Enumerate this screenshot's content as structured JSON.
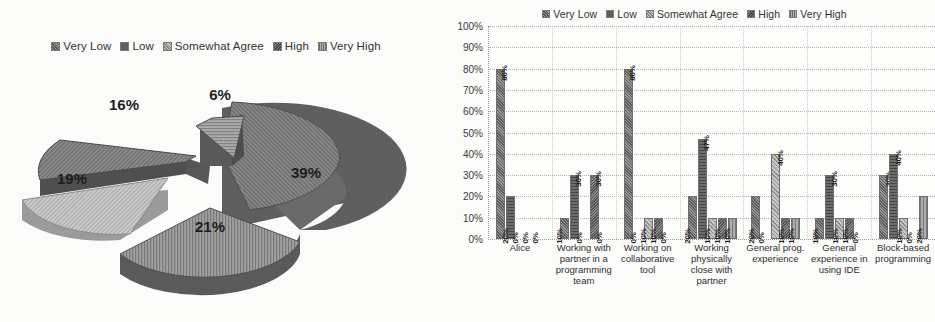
{
  "legend": {
    "entries": [
      {
        "label": "Very Low",
        "key": "verylow",
        "color": "#9a9a9a"
      },
      {
        "label": "Low",
        "key": "low",
        "color": "#5f5f5f"
      },
      {
        "label": "Somewhat Agree",
        "key": "somewhat",
        "color": "#c9c9c9"
      },
      {
        "label": "High",
        "key": "high",
        "color": "#7d7d7d"
      },
      {
        "label": "Very High",
        "key": "veryhigh",
        "color": "#b3b3b3"
      }
    ]
  },
  "chart_data": [
    {
      "type": "pie",
      "title": "",
      "exploded": true,
      "three_d": true,
      "legend_position": "top",
      "categories": [
        "Very Low",
        "Low",
        "Somewhat Agree",
        "High",
        "Very High"
      ],
      "labels": [
        "39%",
        "21%",
        "19%",
        "16%",
        "6%"
      ],
      "values": [
        39,
        21,
        19,
        16,
        6
      ],
      "slices": [
        {
          "label": "39%",
          "value": 39,
          "category": "Very Low",
          "fill": "#8e8e8e"
        },
        {
          "label": "21%",
          "value": 21,
          "category": "Low",
          "fill": "#8a8a8a"
        },
        {
          "label": "19%",
          "value": 19,
          "category": "Somewhat Agree",
          "fill": "#c9c9c9"
        },
        {
          "label": "16%",
          "value": 16,
          "category": "High",
          "fill": "#9d9d9d"
        },
        {
          "label": "6%",
          "value": 6,
          "category": "Very High",
          "fill": "#a8a8a8"
        }
      ]
    },
    {
      "type": "bar",
      "title": "",
      "xlabel": "",
      "ylabel": "",
      "ylim": [
        0,
        100
      ],
      "grid": true,
      "legend_position": "top",
      "y_ticks": [
        "0%",
        "10%",
        "20%",
        "30%",
        "40%",
        "50%",
        "60%",
        "70%",
        "80%",
        "90%",
        "100%"
      ],
      "categories": [
        "Alice",
        "Working with partner in a programming team",
        "Working on collaborative tool",
        "Working physically close with partner",
        "General prog. experience",
        "General experience in using IDE",
        "Block-based programming"
      ],
      "series": [
        {
          "name": "Very Low",
          "values": [
            80,
            10,
            80,
            20,
            20,
            10,
            30
          ]
        },
        {
          "name": "Low",
          "values": [
            20,
            30,
            0,
            47,
            0,
            30,
            40
          ]
        },
        {
          "name": "Somewhat Agree",
          "values": [
            0,
            0,
            10,
            10,
            40,
            10,
            10
          ]
        },
        {
          "name": "High",
          "values": [
            0,
            30,
            10,
            10,
            10,
            10,
            0
          ]
        },
        {
          "name": "Very High",
          "values": [
            0,
            0,
            0,
            10,
            10,
            0,
            20
          ]
        }
      ],
      "bar_labels": [
        [
          "80%",
          "20%",
          "0%",
          "0%",
          "0%"
        ],
        [
          "10%",
          "30%",
          "0%",
          "30%",
          "0%"
        ],
        [
          "80%",
          "0%",
          "10%",
          "10%",
          "0%"
        ],
        [
          "20%",
          "47%",
          "10%",
          "10%",
          "10%"
        ],
        [
          "20%",
          "0%",
          "40%",
          "10%",
          "10%"
        ],
        [
          "10%",
          "30%",
          "10%",
          "10%",
          "0%"
        ],
        [
          "30%",
          "40%",
          "10%",
          "0%",
          "20%"
        ]
      ]
    }
  ]
}
